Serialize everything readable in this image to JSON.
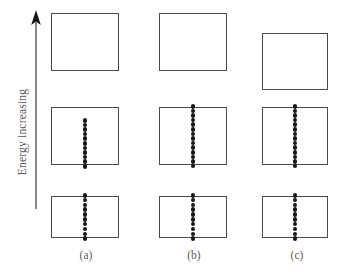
{
  "figure": {
    "background_color": "#ffffff",
    "box_stroke_color": "#4a4a4c",
    "dot_color": "#17171a",
    "text_color": "#58585a"
  },
  "axis": {
    "name": "energy-axis",
    "label": "Energy increasing",
    "direction": "up",
    "arrow_tip_y": 11,
    "arrow_base_y": 209,
    "arrow_x": 36
  },
  "columns": [
    {
      "id": "a",
      "caption": "(a)",
      "caption_x": 66,
      "bands": [
        {
          "name": "conduction-band",
          "x": 51,
          "y": 13,
          "width": 68,
          "height": 58,
          "electrons": 0,
          "dot_top": 0,
          "dot_height": 0
        },
        {
          "name": "valence-band",
          "x": 51,
          "y": 107,
          "width": 68,
          "height": 58,
          "electrons": 11,
          "dot_top": 118,
          "dot_height": 47
        },
        {
          "name": "core-band",
          "x": 51,
          "y": 196,
          "width": 68,
          "height": 42,
          "electrons": 10,
          "dot_top": 193,
          "dot_height": 48
        }
      ]
    },
    {
      "id": "b",
      "caption": "(b)",
      "caption_x": 174,
      "bands": [
        {
          "name": "conduction-band",
          "x": 159,
          "y": 13,
          "width": 68,
          "height": 58,
          "electrons": 0,
          "dot_top": 0,
          "dot_height": 0
        },
        {
          "name": "valence-band",
          "x": 159,
          "y": 107,
          "width": 68,
          "height": 58,
          "electrons": 14,
          "dot_top": 104,
          "dot_height": 64
        },
        {
          "name": "core-band",
          "x": 159,
          "y": 196,
          "width": 68,
          "height": 42,
          "electrons": 10,
          "dot_top": 193,
          "dot_height": 48
        }
      ]
    },
    {
      "id": "c",
      "caption": "(c)",
      "caption_x": 277,
      "bands": [
        {
          "name": "conduction-band",
          "x": 262,
          "y": 33,
          "width": 66,
          "height": 57,
          "electrons": 0,
          "dot_top": 0,
          "dot_height": 0
        },
        {
          "name": "valence-band",
          "x": 262,
          "y": 107,
          "width": 66,
          "height": 58,
          "electrons": 14,
          "dot_top": 104,
          "dot_height": 64
        },
        {
          "name": "core-band",
          "x": 262,
          "y": 196,
          "width": 66,
          "height": 42,
          "electrons": 10,
          "dot_top": 193,
          "dot_height": 48
        }
      ]
    }
  ]
}
